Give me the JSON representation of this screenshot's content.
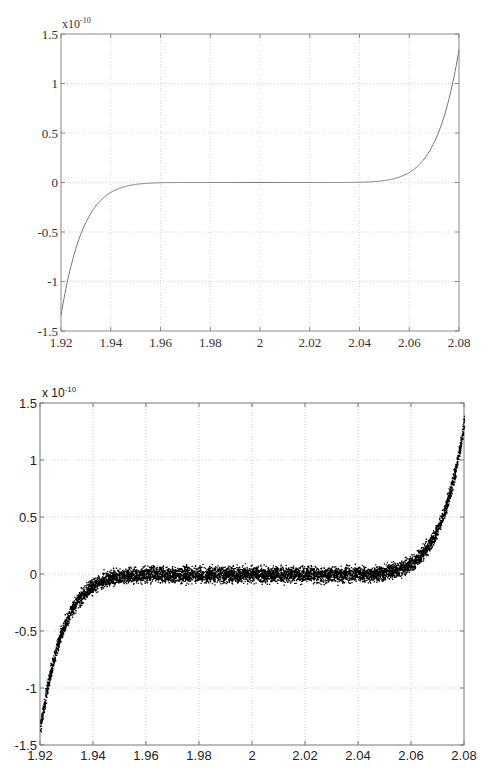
{
  "chart_data": [
    {
      "type": "line",
      "title": "",
      "xlabel": "",
      "ylabel": "",
      "y_scale_label": "x10",
      "y_scale_exponent": "-10",
      "xlim": [
        1.92,
        2.08
      ],
      "ylim": [
        -1.5,
        1.5
      ],
      "x_ticks": [
        "1.92",
        "1.94",
        "1.96",
        "1.98",
        "2",
        "2.02",
        "2.04",
        "2.06",
        "2.08"
      ],
      "y_ticks": [
        "1.5",
        "1",
        "0.5",
        "0",
        "-0.5",
        "-1",
        "-1.5"
      ],
      "grid": true,
      "legend": null,
      "series": [
        {
          "name": "(x-2)^9",
          "function": "(x-2)^9 * 1e10",
          "x": [
            1.92,
            1.93,
            1.94,
            1.95,
            1.96,
            1.97,
            1.98,
            1.99,
            2.0,
            2.01,
            2.02,
            2.03,
            2.04,
            2.05,
            2.06,
            2.07,
            2.08
          ],
          "y": [
            -1.342,
            -0.404,
            -0.101,
            -0.02,
            -0.003,
            -0.0002,
            0.0,
            0.0,
            0.0,
            0.0,
            0.0,
            0.0002,
            0.003,
            0.02,
            0.101,
            0.404,
            1.342
          ],
          "color": "#777777"
        }
      ]
    },
    {
      "type": "scatter",
      "title": "",
      "xlabel": "",
      "ylabel": "",
      "y_scale_label": "x 10",
      "y_scale_exponent": "-10",
      "xlim": [
        1.92,
        2.08
      ],
      "ylim": [
        -1.5,
        1.5
      ],
      "x_ticks": [
        "1.92",
        "1.94",
        "1.96",
        "1.98",
        "2",
        "2.02",
        "2.04",
        "2.06",
        "2.08"
      ],
      "y_ticks": [
        "1.5",
        "1",
        "0.5",
        "0",
        "-0.5",
        "-1",
        "-1.5"
      ],
      "grid": true,
      "legend": null,
      "series": [
        {
          "name": "expanded polynomial evaluation (rounding noise)",
          "underlying_function": "(x-2)^9 * 1e10",
          "noise_amplitude": 0.1,
          "x": [
            1.92,
            1.93,
            1.94,
            1.95,
            1.96,
            1.97,
            1.98,
            1.99,
            2.0,
            2.01,
            2.02,
            2.03,
            2.04,
            2.05,
            2.06,
            2.07,
            2.08
          ],
          "y": [
            -1.34,
            -0.4,
            -0.1,
            -0.02,
            0.0,
            0.0,
            0.0,
            0.0,
            0.0,
            0.0,
            0.0,
            0.0,
            0.0,
            0.02,
            0.1,
            0.4,
            1.34
          ],
          "point_count": 8000,
          "color": "#000000"
        }
      ]
    }
  ]
}
